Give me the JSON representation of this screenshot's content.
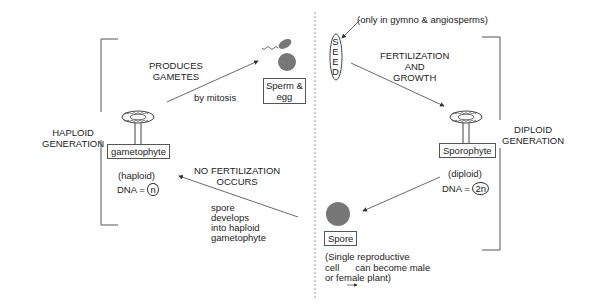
{
  "diagram": {
    "left_generation": {
      "label_line1": "HAPLOID",
      "label_line2": "GENERATION",
      "organism": "gametophyte",
      "ploidy": "(haploid)",
      "dna_prefix": "DNA =",
      "dna_value": "n"
    },
    "right_generation": {
      "label_line1": "DIPLOID",
      "label_line2": "GENERATION",
      "organism": "Sporophyte",
      "ploidy": "(diploid)",
      "dna_prefix": "DNA =",
      "dna_value": "2n"
    },
    "gametes": {
      "box_line1": "Sperm &",
      "box_line2": "egg",
      "arrow_label_line1": "PRODUCES",
      "arrow_label_line2": "GAMETES",
      "arrow_sublabel": "by mitosis"
    },
    "seed": {
      "letters": [
        "S",
        "E",
        "E",
        "D"
      ],
      "note": "(only in gymno & angiosperms)",
      "arrow_label_line1": "FERTILIZATION",
      "arrow_label_line2": "AND",
      "arrow_label_line3": "GROWTH"
    },
    "spore": {
      "box": "Spore",
      "desc_line1": "(Single reproductive",
      "desc_line2_a": "cell",
      "desc_line2_b": "can become male",
      "desc_line3": "or female plant)"
    },
    "spore_to_gametophyte": {
      "label_line1": "NO FERTILIZATION",
      "label_line2": "OCCURS",
      "sub_line1": "spore",
      "sub_line2": "develops",
      "sub_line3": "into haploid",
      "sub_line4": "gametophyte"
    },
    "colors": {
      "line": "#444444",
      "cell_fill": "#777777",
      "divider": "#999999"
    }
  }
}
